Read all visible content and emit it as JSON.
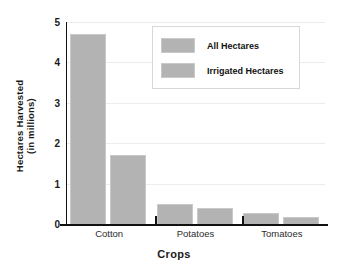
{
  "chart_data": {
    "type": "bar",
    "title": "",
    "xlabel": "Crops",
    "ylabel": "Hectares Harvested (in millions)",
    "ylabel_line1": "Hectares Harvested",
    "ylabel_line2": "(in millions)",
    "categories": [
      "Cotton",
      "Potatoes",
      "Tomatoes"
    ],
    "series": [
      {
        "name": "All Hectares",
        "values": [
          4.7,
          0.5,
          0.28
        ],
        "color": "#b3b3b3"
      },
      {
        "name": "Irrigated Hectares",
        "values": [
          1.7,
          0.4,
          0.17
        ],
        "color": "#b3b3b3"
      }
    ],
    "ylim": [
      0,
      5
    ],
    "yticks": [
      "0",
      "1",
      "2",
      "3",
      "4",
      "5"
    ],
    "ytick_values": [
      0,
      1,
      2,
      3,
      4,
      5
    ],
    "grid": true,
    "grid_axis": "y",
    "legend_position": "top-center-right",
    "legend_entries": [
      "All Hectares",
      "Irrigated Hectares"
    ],
    "background_color": "#ffffff",
    "axis_color": "#111111",
    "grid_color": "#ececed"
  }
}
